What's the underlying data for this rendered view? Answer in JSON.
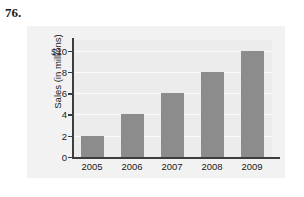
{
  "problem": {
    "number": "76."
  },
  "chart_data": {
    "type": "bar",
    "title": "",
    "xlabel": "",
    "ylabel": "Sales (in millions)",
    "categories": [
      "2005",
      "2006",
      "2007",
      "2008",
      "2009"
    ],
    "values": [
      2,
      4,
      6,
      8,
      10
    ],
    "ytick_values": [
      0,
      2,
      4,
      6,
      8,
      10
    ],
    "ytick_labels": [
      "0",
      "2",
      "4",
      "6",
      "8",
      "$10"
    ],
    "ylim": [
      0,
      11
    ],
    "grid": true,
    "legend": "none",
    "series": [
      {
        "name": "Sales",
        "values": [
          2,
          4,
          6,
          8,
          10
        ]
      }
    ],
    "colors": {
      "bar": "#8c8c8c",
      "plot_background": "#ececec",
      "panel_background": "#f2f2f2",
      "axis": "#3d3d3d",
      "gridline": "#fbfbfb",
      "text": "#202020"
    }
  }
}
